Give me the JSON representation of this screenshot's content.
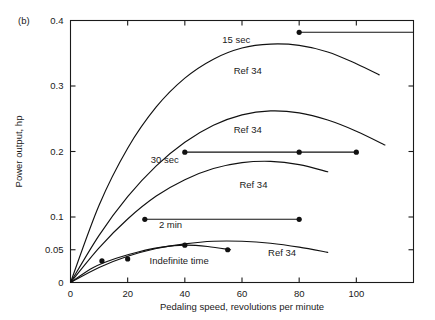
{
  "figure": {
    "panel_label": "(b)",
    "xlabel": "Pedaling speed, revolutions per minute",
    "ylabel": "Power output, hp"
  },
  "chart_data": {
    "type": "line",
    "title": "",
    "subtitle": "",
    "panel": "(b)",
    "xlabel": "Pedaling speed, revolutions per minute",
    "ylabel": "Power output, hp",
    "xlim": [
      0,
      120
    ],
    "ylim": [
      0,
      0.4
    ],
    "grid": false,
    "legend": "none",
    "x_ticks": [
      0,
      20,
      40,
      60,
      80,
      100
    ],
    "x_tick_labels": [
      "0",
      "20",
      "40",
      "60",
      "80",
      "100"
    ],
    "y_ticks": [
      0,
      0.05,
      0.1,
      0.2,
      0.3,
      0.4
    ],
    "y_tick_labels": [
      "0",
      "0.05",
      "0.1",
      "0.2",
      "0.3",
      "0.4"
    ],
    "series": [
      {
        "name": "15 sec",
        "kind": "horizontal-line-with-markers",
        "label": "15 sec",
        "label_x": 58,
        "label_y": 0.366,
        "y_value": 0.382,
        "x_start": 80,
        "x_end": 120,
        "markers_x": [
          80
        ],
        "markers_y": [
          0.382
        ]
      },
      {
        "name": "Ref 34 (15 sec curve)",
        "kind": "curve",
        "label": "Ref 34",
        "label_x": 62,
        "label_y": 0.318,
        "x": [
          0,
          10,
          20,
          30,
          40,
          50,
          60,
          70,
          80,
          90,
          100,
          108
        ],
        "y": [
          0.0,
          0.118,
          0.205,
          0.268,
          0.312,
          0.341,
          0.358,
          0.364,
          0.362,
          0.352,
          0.334,
          0.317
        ]
      },
      {
        "name": "Ref 34 (upper-mid curve)",
        "kind": "curve",
        "label": "Ref 34",
        "label_x": 62,
        "label_y": 0.228,
        "x": [
          0,
          10,
          20,
          30,
          40,
          50,
          60,
          70,
          80,
          90,
          100,
          110
        ],
        "y": [
          0.0,
          0.072,
          0.131,
          0.178,
          0.214,
          0.24,
          0.256,
          0.262,
          0.259,
          0.248,
          0.231,
          0.21
        ]
      },
      {
        "name": "30 sec",
        "kind": "horizontal-line-with-markers",
        "label": "30 sec",
        "label_x": 33,
        "label_y": 0.183,
        "y_value": 0.199,
        "x_start": 40,
        "x_end": 100,
        "markers_x": [
          40,
          80,
          100
        ],
        "markers_y": [
          0.199,
          0.199,
          0.199
        ]
      },
      {
        "name": "Ref 34 (lower-mid curve)",
        "kind": "curve",
        "label": "Ref 34",
        "label_x": 64,
        "label_y": 0.145,
        "x": [
          0,
          10,
          20,
          30,
          40,
          50,
          60,
          70,
          80,
          90
        ],
        "y": [
          0.0,
          0.053,
          0.097,
          0.132,
          0.157,
          0.174,
          0.183,
          0.185,
          0.18,
          0.169
        ]
      },
      {
        "name": "2 min",
        "kind": "horizontal-line-with-markers",
        "label": "2 min",
        "label_x": 35,
        "label_y": 0.083,
        "y_value": 0.0965,
        "x_start": 26,
        "x_end": 80,
        "markers_x": [
          26,
          80
        ],
        "markers_y": [
          0.0965,
          0.0965
        ]
      },
      {
        "name": "Ref 34 (bottom curve)",
        "kind": "curve",
        "label": "Ref 34",
        "label_x": 74,
        "label_y": 0.04,
        "x": [
          0,
          10,
          20,
          30,
          40,
          50,
          60,
          70,
          80,
          90
        ],
        "y": [
          0.0,
          0.023,
          0.04,
          0.052,
          0.059,
          0.063,
          0.063,
          0.06,
          0.054,
          0.046
        ]
      },
      {
        "name": "Indefinite time",
        "kind": "curve-with-markers",
        "label": "Indefinite time",
        "label_x": 38,
        "label_y": 0.029,
        "x": [
          0,
          8,
          16,
          24,
          32,
          40,
          48,
          56
        ],
        "y": [
          0.0,
          0.023,
          0.037,
          0.047,
          0.054,
          0.057,
          0.055,
          0.05
        ],
        "markers_x": [
          11,
          20,
          40,
          55
        ],
        "markers_y": [
          0.033,
          0.036,
          0.057,
          0.05
        ]
      }
    ],
    "annotations": [
      {
        "text": "15 sec",
        "x": 58,
        "y": 0.366
      },
      {
        "text": "Ref 34",
        "x": 62,
        "y": 0.318
      },
      {
        "text": "Ref 34",
        "x": 62,
        "y": 0.228
      },
      {
        "text": "30 sec",
        "x": 33,
        "y": 0.183
      },
      {
        "text": "Ref 34",
        "x": 64,
        "y": 0.145
      },
      {
        "text": "2 min",
        "x": 35,
        "y": 0.083
      },
      {
        "text": "Ref 34",
        "x": 74,
        "y": 0.04
      },
      {
        "text": "Indefinite time",
        "x": 38,
        "y": 0.029
      }
    ]
  }
}
